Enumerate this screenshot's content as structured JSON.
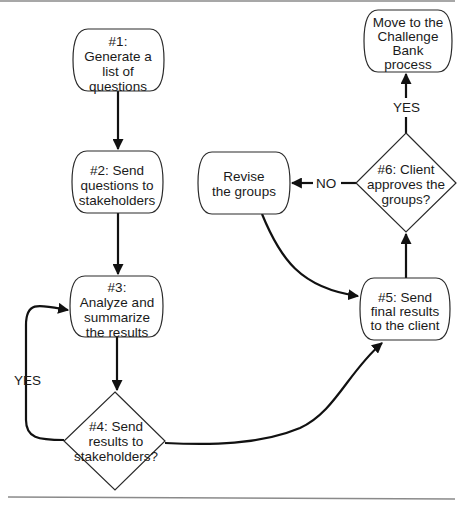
{
  "nodes": {
    "n1": {
      "lines": [
        "#1:",
        "Generate a",
        "list of",
        "questions"
      ]
    },
    "n2": {
      "lines": [
        "#2: Send",
        "questions to",
        "stakeholders"
      ]
    },
    "n3": {
      "lines": [
        "#3:",
        "Analyze and",
        "summarize",
        "the results"
      ]
    },
    "n4": {
      "lines": [
        "#4: Send",
        "results to",
        "stakeholders?"
      ]
    },
    "n5": {
      "lines": [
        "#5: Send",
        "final results",
        "to the client"
      ]
    },
    "n6": {
      "lines": [
        "#6: Client",
        "approves the",
        "groups?"
      ]
    },
    "revise": {
      "lines": [
        "Revise",
        "the groups"
      ]
    },
    "move": {
      "lines": [
        "Move to the",
        "Challenge",
        "Bank",
        "process"
      ]
    }
  },
  "edge_labels": {
    "n4_yes": "YES",
    "n6_yes": "YES",
    "n6_no": "NO"
  },
  "colors": {
    "stroke": "#2a2a2a",
    "edge": "#111111",
    "rule": "#8a8a8a"
  }
}
